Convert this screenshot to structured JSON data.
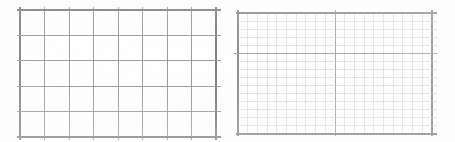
{
  "page": {
    "background_color": "#ffffff",
    "width": 455,
    "height": 142
  },
  "panels": [
    {
      "id": "left-grid",
      "label": "Coarse Grid Panel",
      "x": 20,
      "y": 10,
      "width": 196,
      "height": 127,
      "columns": 8,
      "rows": 5,
      "cell_width": 24.5,
      "cell_height": 25.4,
      "minor_color": "#9d9d9d",
      "major_color": "#6f6f6f",
      "axis_color": "#5a5a5a",
      "minor_width": 0.7,
      "major_width": 0.9,
      "axis_width": 1.1,
      "tick_overhang": 6,
      "has_right_ticks": true,
      "has_top_rule": true
    },
    {
      "id": "right-grid",
      "label": "Fine Grid Panel",
      "x": 238,
      "y": 13,
      "width": 194,
      "height": 121,
      "columns": 20,
      "rows": 15,
      "cell_width": 9.7,
      "cell_height": 8.07,
      "minor_color": "#bdbdbd",
      "major_color": "#8a8a8a",
      "axis_color": "#6b6b6b",
      "minor_width": 0.55,
      "major_width": 1.0,
      "axis_width": 1.1,
      "major_column_interval": 10,
      "major_row_interval": 15,
      "emphasis_row_index": 5,
      "tick_overhang": 5,
      "has_right_ticks": true,
      "has_top_rule": true
    }
  ],
  "chart_data": {
    "type": "table",
    "title": "",
    "xlabel": "",
    "ylabel": "",
    "series": [],
    "categories": [],
    "values": []
  }
}
